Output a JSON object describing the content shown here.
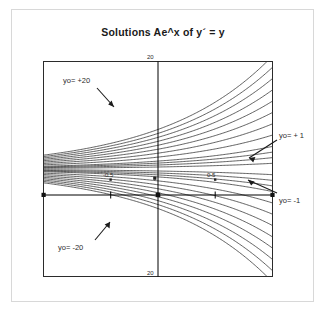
{
  "chart_data": {
    "type": "line",
    "title": "Solutions Ae^x of y´ = y",
    "xlabel": "",
    "ylabel": "",
    "xlim": [
      -1.05,
      1.05
    ],
    "ylim": [
      -20,
      20
    ],
    "grid": false,
    "legend_position": "none",
    "x_ticks": [
      -0.5,
      0.5
    ],
    "x_tick_labels": [
      "-0.5",
      "0.5"
    ],
    "y_ticks": [
      -20,
      20
    ],
    "y_tick_labels": [
      "20",
      "20"
    ],
    "axis_origin_label": "0",
    "series_formula": "y = A * e^x",
    "series": [
      {
        "name": "A = -7.36",
        "A": -7.36
      },
      {
        "name": "A = -6.62",
        "A": -6.62
      },
      {
        "name": "A = -5.89",
        "A": -5.89
      },
      {
        "name": "A = -5.15",
        "A": -5.15
      },
      {
        "name": "A = -4.42",
        "A": -4.42
      },
      {
        "name": "A = -3.68",
        "A": -3.68
      },
      {
        "name": "A = -2.94",
        "A": -2.94
      },
      {
        "name": "A = -2.21",
        "A": -2.21
      },
      {
        "name": "A = -1.47",
        "A": -1.47
      },
      {
        "name": "A = -1.10",
        "A": -1.1
      },
      {
        "name": "A = -0.74",
        "A": -0.74
      },
      {
        "name": "A = -0.37",
        "A": -0.37
      },
      {
        "name": "A = 0",
        "A": 0
      },
      {
        "name": "A = 0.37",
        "A": 0.37
      },
      {
        "name": "A = 0.74",
        "A": 0.74
      },
      {
        "name": "A = 1.10",
        "A": 1.1
      },
      {
        "name": "A = 1.47",
        "A": 1.47
      },
      {
        "name": "A = 2.21",
        "A": 2.21
      },
      {
        "name": "A = 2.94",
        "A": 2.94
      },
      {
        "name": "A = 3.68",
        "A": 3.68
      },
      {
        "name": "A = 4.42",
        "A": 4.42
      },
      {
        "name": "A = 5.15",
        "A": 5.15
      },
      {
        "name": "A = 5.89",
        "A": 5.89
      },
      {
        "name": "A = 6.62",
        "A": 6.62
      },
      {
        "name": "A = 7.36",
        "A": 7.36
      }
    ],
    "annotations": [
      {
        "id": "top-20",
        "text": "yo= +20",
        "points_to": "upper band of curves"
      },
      {
        "id": "bottom-20",
        "text": "yo= -20",
        "points_to": "lower band of curves"
      },
      {
        "id": "plus-1",
        "text": "yo= + 1",
        "points_to": "curve just above the x axis at right edge"
      },
      {
        "id": "minus-1",
        "text": "yo= -1",
        "points_to": "curve just below the x axis at right edge"
      }
    ],
    "colors": {
      "curve": "#3a3a3a",
      "axis": "#000000",
      "frame": "#2b2b2b",
      "text": "#1a1a1a",
      "background": "#ffffff",
      "outer_border": "#d8d8d8"
    }
  },
  "figure": {
    "title": "Solutions Ae^x of y´ = y",
    "ticks": {
      "top": "20",
      "bottom": "20",
      "neg_half": "-0.5",
      "pos_half": "0.5",
      "origin": "0"
    },
    "annotations": {
      "top20": "yo= +20",
      "bottom20": "yo= -20",
      "plus1": "yo= + 1",
      "minus1": "yo= -1"
    }
  }
}
